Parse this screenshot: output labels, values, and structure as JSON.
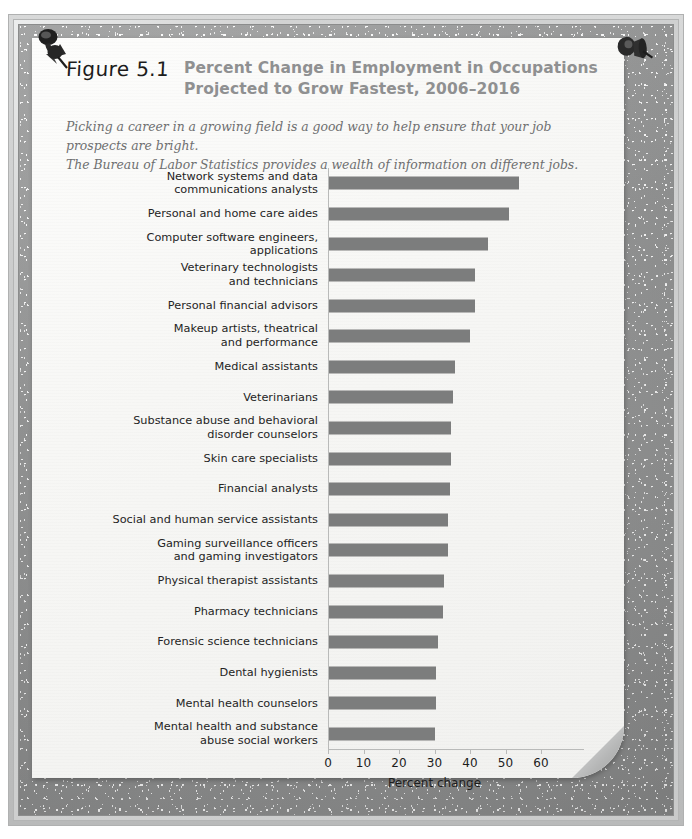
{
  "figure": {
    "number_label": "Figure 5.1",
    "title_line1": "Percent Change in Employment in Occupations",
    "title_line2": "Projected to Grow Fastest, 2006–2016",
    "caption_line1": "Picking a career in a growing field is a good way to help ensure that your job prospects are bright.",
    "caption_line2": "The Bureau of Labor Statistics provides a wealth of information on different jobs.",
    "title_color": "#8f9091",
    "bar_color": "#7c7d7d",
    "paper_color": "#f8f8f6",
    "frame_color": "#9b9c9c"
  },
  "pins": {
    "top_left_icon": "pushpin-icon",
    "top_right_icon": "pushpin-icon"
  },
  "chart_data": {
    "type": "bar",
    "orientation": "horizontal",
    "title": "Percent Change in Employment in Occupations Projected to Grow Fastest, 2006–2016",
    "xlabel": "Percent change",
    "ylabel": "",
    "xlim": [
      0,
      60
    ],
    "xticks": [
      0,
      10,
      20,
      30,
      40,
      50,
      60
    ],
    "xtick_labels": [
      "0",
      "10",
      "20",
      "30",
      "40",
      "50",
      "60"
    ],
    "grid": false,
    "legend": null,
    "categories": [
      "Network systems and data\ncommunications analysts",
      "Personal and home care aides",
      "Computer software engineers,\napplications",
      "Veterinary technologists\nand technicians",
      "Personal financial advisors",
      "Makeup artists, theatrical\nand performance",
      "Medical assistants",
      "Veterinarians",
      "Substance abuse and behavioral\ndisorder counselors",
      "Skin care specialists",
      "Financial analysts",
      "Social and human service assistants",
      "Gaming surveillance officers\nand gaming investigators",
      "Physical therapist assistants",
      "Pharmacy technicians",
      "Forensic science technicians",
      "Dental hygienists",
      "Mental health counselors",
      "Mental health and substance\nabuse social workers"
    ],
    "values": [
      53.4,
      50.6,
      44.7,
      41.0,
      41.0,
      39.8,
      35.4,
      35.0,
      34.3,
      34.3,
      34.0,
      33.6,
      33.6,
      32.4,
      32.0,
      30.7,
      30.1,
      30.0,
      29.9
    ]
  }
}
